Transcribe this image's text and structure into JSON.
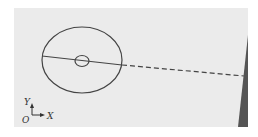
{
  "diagram": {
    "background": "#ebebeb",
    "stroke": "#444444",
    "wedge_color": "#555555",
    "axes": {
      "y_label": "Y",
      "x_label": "X",
      "origin_label": "O"
    },
    "elements": [
      {
        "type": "ellipse",
        "label": "outer-ellipse"
      },
      {
        "type": "circle",
        "label": "inner-circle"
      },
      {
        "type": "line",
        "label": "solid-axis-line"
      },
      {
        "type": "dashed-line",
        "label": "dashed-extension"
      },
      {
        "type": "wedge",
        "label": "dark-wedge"
      }
    ]
  }
}
